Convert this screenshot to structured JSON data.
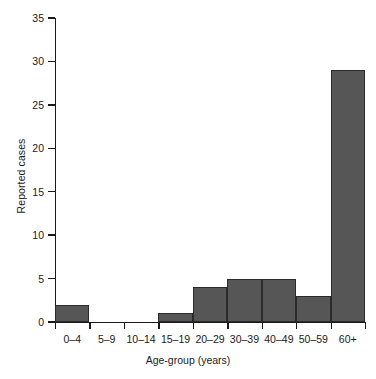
{
  "chart_data": {
    "type": "bar",
    "title": "",
    "xlabel": "Age-group (years)",
    "ylabel": "Reported cases",
    "categories": [
      "0–4",
      "5–9",
      "10–14",
      "15–19",
      "20–29",
      "30–39",
      "40–49",
      "50–59",
      "60+"
    ],
    "values": [
      2,
      0,
      0,
      1,
      4,
      5,
      5,
      3,
      29
    ],
    "ylim": [
      0,
      35
    ],
    "yticks": [
      0,
      5,
      10,
      15,
      20,
      25,
      30,
      35
    ],
    "ytick_labels": [
      "0",
      "5",
      "10",
      "15",
      "20",
      "25",
      "30",
      "35"
    ],
    "grid": false,
    "legend": null,
    "bar_color": "#565656",
    "bar_edge_color": "#2b2b2b",
    "axis_color": "#1a1a1a",
    "background_color": "#ffffff"
  }
}
